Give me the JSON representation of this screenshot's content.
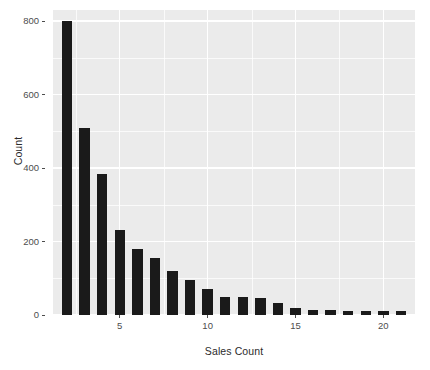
{
  "chart_data": {
    "type": "bar",
    "title": "",
    "subtitle": "",
    "xlabel": "Sales Count",
    "ylabel": "Count",
    "categories": [
      2,
      3,
      4,
      5,
      6,
      7,
      8,
      9,
      10,
      11,
      12,
      13,
      14,
      15,
      16,
      17,
      18,
      19,
      20,
      21
    ],
    "values": [
      800,
      510,
      385,
      230,
      180,
      155,
      120,
      95,
      70,
      50,
      48,
      45,
      33,
      18,
      14,
      14,
      11,
      11,
      10,
      10
    ],
    "series": [
      {
        "name": "Count",
        "values": [
          800,
          510,
          385,
          230,
          180,
          155,
          120,
          95,
          70,
          50,
          48,
          45,
          33,
          18,
          14,
          14,
          11,
          11,
          10,
          10
        ]
      }
    ],
    "xlim": [
      1.2,
      21.8
    ],
    "ylim": [
      0,
      830
    ],
    "x_ticks": [
      5,
      10,
      15,
      20
    ],
    "x_tick_labels": [
      "5",
      "10",
      "15",
      "20"
    ],
    "y_ticks": [
      0,
      200,
      400,
      600,
      800
    ],
    "y_tick_labels": [
      "0",
      "200",
      "400",
      "600",
      "800"
    ],
    "y_minor_ticks": [
      100,
      300,
      500,
      700
    ],
    "x_minor_ticks": [
      2.5,
      7.5,
      12.5,
      17.5
    ],
    "grid": true,
    "legend": "none",
    "bar_color": "#1a1a1a",
    "panel_color": "#ebebeb",
    "grid_color": "#ffffff",
    "bar_width": 0.6,
    "annotations": []
  }
}
